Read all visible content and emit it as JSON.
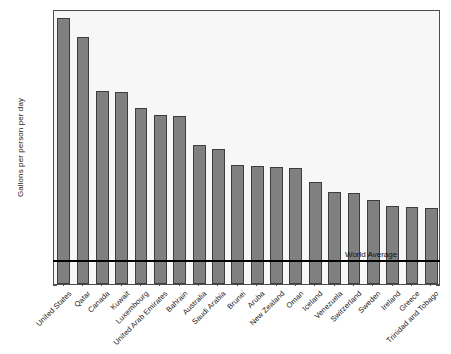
{
  "chart_data": {
    "type": "bar",
    "title": "",
    "xlabel": "",
    "ylabel": "Gallons per person per day",
    "ylim": [
      0,
      1.28
    ],
    "yticks": [
      0,
      0.2,
      0.4,
      0.6,
      0.8,
      1,
      1.2
    ],
    "ytick_labels": [
      "0",
      "0.2",
      "0.4",
      "0.6",
      "0.8",
      "1",
      "1.2"
    ],
    "grid": false,
    "legend": null,
    "bar_color": "#808080",
    "bar_edge_color": "#3d3d3d",
    "plot_background": "#f7f7f7",
    "categories": [
      "United States",
      "Qatar",
      "Canada",
      "Kuwait",
      "Luxembourg",
      "United Arab Emirates",
      "Bahrain",
      "Australia",
      "Saudi Arabia",
      "Brunei",
      "Aruba",
      "New Zealand",
      "Oman",
      "Iceland",
      "Venezuela",
      "Switzerland",
      "Sweden",
      "Ireland",
      "Greece",
      "Trinidad and Tobago"
    ],
    "values": [
      1.24,
      1.15,
      0.9,
      0.895,
      0.82,
      0.785,
      0.78,
      0.645,
      0.63,
      0.555,
      0.55,
      0.545,
      0.54,
      0.475,
      0.43,
      0.425,
      0.39,
      0.365,
      0.36,
      0.355
    ],
    "annotations": [
      {
        "name": "world-average",
        "label": "World Average",
        "type": "hline",
        "value": 0.11,
        "color": "#000000"
      }
    ]
  }
}
